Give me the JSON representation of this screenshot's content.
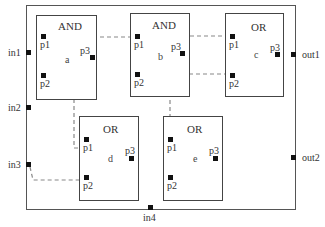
{
  "diagram": {
    "outer_ports": {
      "in1": "in1",
      "in2": "in2",
      "in3": "in3",
      "in4": "in4",
      "out1": "out1",
      "out2": "out2"
    },
    "blocks": [
      {
        "id": "a",
        "type": "AND",
        "name": "a",
        "pins": [
          "p1",
          "p2",
          "p3"
        ]
      },
      {
        "id": "b",
        "type": "AND",
        "name": "b",
        "pins": [
          "p1",
          "p2",
          "p3"
        ]
      },
      {
        "id": "c",
        "type": "OR",
        "name": "c",
        "pins": [
          "p1",
          "p2",
          "p3"
        ]
      },
      {
        "id": "d",
        "type": "OR",
        "name": "d",
        "pins": [
          "p1",
          "p2",
          "p3"
        ]
      },
      {
        "id": "e",
        "type": "OR",
        "name": "e",
        "pins": [
          "p1",
          "p2",
          "p3"
        ]
      }
    ],
    "connections": [
      {
        "from": "a.p3",
        "to": "b.p1",
        "style": "dashed"
      },
      {
        "from": "a.p3",
        "to": "d.p1",
        "style": "dashed"
      },
      {
        "from": "b.p3",
        "to": "c.p1",
        "style": "dashed"
      },
      {
        "from": "c.p2",
        "to": "e.p1",
        "style": "dashed"
      },
      {
        "from": "in3",
        "to": "d.p2",
        "style": "dashed"
      }
    ],
    "colors": {
      "line": "#444444",
      "pin": "#111111",
      "dash": "#888888"
    }
  }
}
